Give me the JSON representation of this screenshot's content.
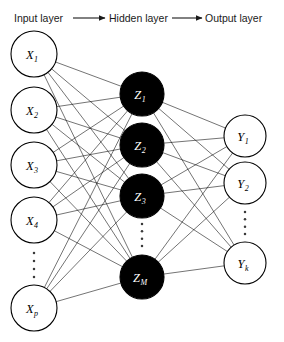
{
  "figure": {
    "background_color": "#ffffff",
    "width": 284,
    "height": 342
  },
  "header": {
    "labels": [
      {
        "text": "Input layer",
        "x": 14,
        "y": 22
      },
      {
        "text": "Hidden layer",
        "x": 109,
        "y": 22
      },
      {
        "text": "Output layer",
        "x": 205,
        "y": 22
      }
    ],
    "arrows": [
      {
        "name": "arrow-input-to-hidden",
        "x1": 73,
        "y1": 18,
        "x2": 105
      },
      {
        "name": "arrow-hidden-to-output",
        "x1": 172,
        "y1": 18,
        "x2": 202
      }
    ]
  },
  "chart_data": {
    "type": "diagram",
    "diagram_kind": "neural-network",
    "layers": [
      {
        "id": "input",
        "name": "Input layer",
        "style": "open",
        "label_color": "#000000",
        "cx": 34,
        "r": 23,
        "nodes": [
          {
            "label": "X",
            "sub": "1",
            "cy": 54
          },
          {
            "label": "X",
            "sub": "2",
            "cy": 110
          },
          {
            "label": "X",
            "sub": "3",
            "cy": 165
          },
          {
            "label": "X",
            "sub": "4",
            "cy": 220
          },
          {
            "label": "X",
            "sub": "p",
            "cy": 308
          }
        ],
        "ellipsis": {
          "cx": 34,
          "y_start": 253,
          "y_end": 277,
          "count": 4
        }
      },
      {
        "id": "hidden",
        "name": "Hidden layer",
        "style": "filled",
        "label_color": "#ffffff",
        "cx": 142,
        "r": 22,
        "nodes": [
          {
            "label": "Z",
            "sub": "1",
            "cy": 94
          },
          {
            "label": "Z",
            "sub": "2",
            "cy": 145
          },
          {
            "label": "Z",
            "sub": "3",
            "cy": 196
          },
          {
            "label": "Z",
            "sub": "M",
            "cy": 277
          }
        ],
        "ellipsis": {
          "cx": 142,
          "y_start": 224,
          "y_end": 246,
          "count": 4
        }
      },
      {
        "id": "output",
        "name": "Output layer",
        "style": "open",
        "label_color": "#000000",
        "cx": 245,
        "r": 21,
        "nodes": [
          {
            "label": "Y",
            "sub": "1",
            "cy": 136
          },
          {
            "label": "Y",
            "sub": "2",
            "cy": 183
          },
          {
            "label": "Y",
            "sub": "k",
            "cy": 263
          }
        ],
        "ellipsis": {
          "cx": 245,
          "y_start": 212,
          "y_end": 234,
          "count": 4
        }
      }
    ],
    "connections": [
      {
        "from": "input",
        "to": "hidden",
        "fully_connected": true
      },
      {
        "from": "hidden",
        "to": "output",
        "fully_connected": true
      }
    ],
    "edge_color": "#000000"
  }
}
